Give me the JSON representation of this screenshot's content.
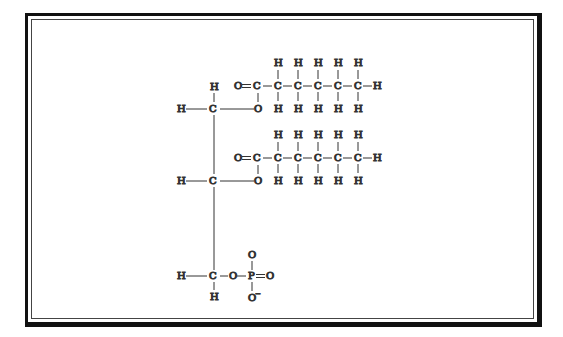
{
  "diagram": {
    "type": "phosphatidic acid structural formula",
    "atoms": {
      "H": "H",
      "C": "C",
      "O": "O",
      "P": "P",
      "O_minus": "O",
      "minus": "−",
      "bond_single_h": "—",
      "bond_double": "="
    },
    "colors": {
      "ink": "#222222",
      "frame": "#111111",
      "background": "#ffffff"
    },
    "structure": {
      "backbone": "glycerol (3 carbons)",
      "chain_1": "O=C-C-C-C-C-CH3 ester at C1",
      "chain_2": "O=C-C-C-C-C-CH3 ester at C2",
      "head": "O-PO3 (phosphate, one O−) at C3"
    }
  }
}
